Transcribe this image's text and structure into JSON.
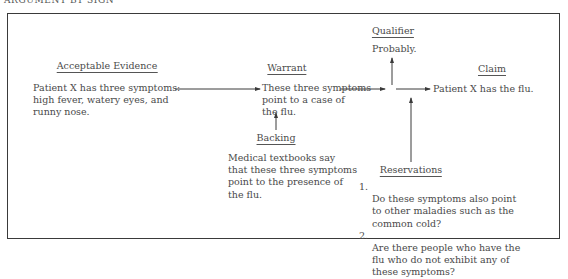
{
  "title": "ARGUMENT BY SIGN",
  "nodes": {
    "evidence": {
      "heading": "Acceptable Evidence",
      "lines": [
        "Patient X has three symptoms:",
        "high fever, watery eyes, and",
        "runny nose."
      ]
    },
    "warrant": {
      "heading": "Warrant",
      "lines": [
        "These three symptoms",
        "point to a case of",
        "the flu."
      ]
    },
    "backing": {
      "heading": "Backing",
      "lines": [
        "Medical textbooks say",
        "that these three symptoms",
        "point to the presence of",
        "the flu."
      ]
    },
    "qualifier": {
      "heading": "Qualifier",
      "text": "Probably."
    },
    "claim": {
      "heading": "Claim",
      "text": "Patient X has the flu."
    },
    "reservations": {
      "heading": "Reservations",
      "items": [
        {
          "num": "1.",
          "text": "Do these symptoms also point\nto other maladies such as the\ncommon cold?"
        },
        {
          "num": "2.",
          "text": "Are there people who have the\nflu who do not exhibit any of\nthese symptoms?"
        }
      ]
    }
  },
  "edges": [
    {
      "from": "evidence",
      "to": "warrant"
    },
    {
      "from": "warrant",
      "to": "junction"
    },
    {
      "from": "junction",
      "to": "qualifier"
    },
    {
      "from": "junction",
      "to": "claim"
    },
    {
      "from": "backing",
      "to": "warrant"
    },
    {
      "from": "reservations",
      "to": "junction"
    }
  ],
  "colors": {
    "ink": "#4a4a4a",
    "frame": "#3a3a3a"
  }
}
